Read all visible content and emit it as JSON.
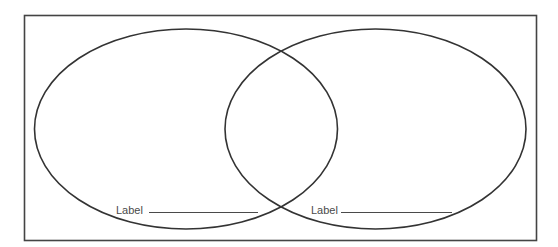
{
  "diagram": {
    "type": "venn",
    "sets": [
      {
        "label": "Label",
        "blank": "______________________"
      },
      {
        "label": "Label",
        "blank": "______________________"
      }
    ],
    "colors": {
      "stroke": "#333333",
      "frame": "#444444",
      "text": "#4a4a4a",
      "background": "#ffffff"
    }
  }
}
